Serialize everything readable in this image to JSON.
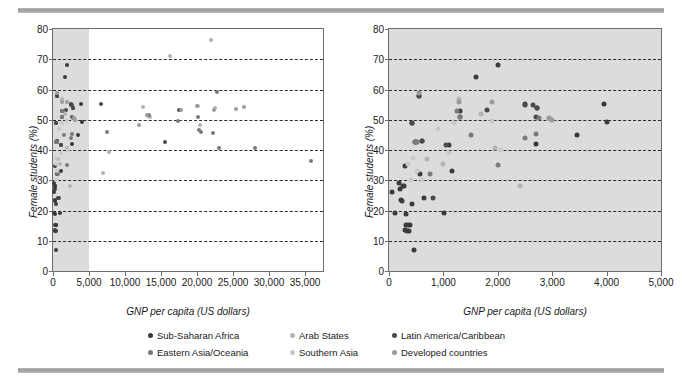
{
  "figure": {
    "background": "#ffffff",
    "rule_color": "#a8a8a8",
    "shade_color": "#dcdcdc",
    "frame_color": "#6e6e6e"
  },
  "series_colors": {
    "sub_saharan_africa": "#3a3a3a",
    "arab_states": "#b4b4b4",
    "latin_america_caribbean": "#4a4a4a",
    "eastern_asia_oceania": "#7a7a7a",
    "southern_asia": "#c9c9c9",
    "developed_countries": "#9b9b9b"
  },
  "legend": {
    "position": "bottom-center",
    "entries": [
      {
        "label": "Sub-Saharan Africa",
        "key": "sub_saharan_africa",
        "color": "#3a3a3a"
      },
      {
        "label": "Arab States",
        "key": "arab_states",
        "color": "#b4b4b4"
      },
      {
        "label": "Latin America/Caribbean",
        "key": "latin_america_caribbean",
        "color": "#4a4a4a"
      },
      {
        "label": "Eastern Asia/Oceania",
        "key": "eastern_asia_oceania",
        "color": "#7a7a7a"
      },
      {
        "label": "Southern Asia",
        "key": "southern_asia",
        "color": "#c9c9c9"
      },
      {
        "label": "Developed countries",
        "key": "developed_countries",
        "color": "#9b9b9b"
      }
    ]
  },
  "chart_data": [
    {
      "id": "left",
      "type": "scatter",
      "title": "",
      "xlabel": "GNP per capita (US dollars)",
      "ylabel": "Female students (%)",
      "xlim": [
        0,
        37500
      ],
      "ylim": [
        0,
        80
      ],
      "xticks": [
        0,
        5000,
        10000,
        15000,
        20000,
        25000,
        30000,
        35000
      ],
      "xtick_labels": [
        "0",
        "5,000",
        "10,000",
        "15,000",
        "20,000",
        "25,000",
        "30,000",
        "35,000"
      ],
      "yticks": [
        0,
        10,
        20,
        30,
        40,
        50,
        60,
        70,
        80
      ],
      "ytick_labels": [
        "0",
        "10",
        "20",
        "30",
        "40",
        "50",
        "60",
        "70",
        "80"
      ],
      "grid": "horizontal-dashed",
      "shaded_x_range": [
        0,
        5000
      ],
      "shade_note": "grey band marks the 0-5,000 region enlarged in the right panel",
      "series": [
        {
          "name": "Sub-Saharan Africa",
          "key": "sub_saharan_africa",
          "points": [
            [
              120,
              26.2
            ],
            [
              150,
              19.3
            ],
            [
              200,
              29.0
            ],
            [
              210,
              27.0
            ],
            [
              230,
              23.5
            ],
            [
              250,
              23.3
            ],
            [
              260,
              28.0
            ],
            [
              280,
              28.0
            ],
            [
              290,
              13.5
            ],
            [
              300,
              34.8
            ],
            [
              310,
              19.0
            ],
            [
              330,
              15.2
            ],
            [
              340,
              13.2
            ],
            [
              350,
              15.2
            ],
            [
              360,
              13.2
            ],
            [
              380,
              15.2
            ],
            [
              400,
              22.0
            ],
            [
              430,
              49.0
            ],
            [
              450,
              7.0
            ],
            [
              470,
              42.8
            ],
            [
              500,
              42.8
            ],
            [
              520,
              58.0
            ],
            [
              560,
              32.0
            ],
            [
              600,
              43.0
            ],
            [
              640,
              24.2
            ],
            [
              1020,
              19.2
            ],
            [
              1100,
              41.8
            ],
            [
              1150,
              33.0
            ],
            [
              1300,
              53.0
            ],
            [
              1600,
              64.2
            ],
            [
              2000,
              68.2
            ],
            [
              2500,
              55.2
            ],
            [
              2700,
              42.0
            ],
            [
              2720,
              54.0
            ],
            [
              3450,
              45.0
            ],
            [
              3950,
              55.2
            ],
            [
              4000,
              49.2
            ]
          ]
        },
        {
          "name": "Arab States",
          "key": "arab_states",
          "points": [
            [
              700,
              37.0
            ],
            [
              1000,
              35.5
            ],
            [
              1280,
              57.0
            ],
            [
              1700,
              52.0
            ],
            [
              1950,
              40.5
            ],
            [
              2400,
              28.0
            ],
            [
              2950,
              50.5
            ],
            [
              3000,
              50.0
            ],
            [
              7000,
              32.3
            ],
            [
              7800,
              39.5
            ],
            [
              12500,
              54.2
            ],
            [
              13200,
              51.2
            ],
            [
              13500,
              51.0
            ],
            [
              16300,
              71.2
            ],
            [
              20200,
              54.5
            ],
            [
              20400,
              48.2
            ],
            [
              22000,
              76.2
            ],
            [
              22500,
              54.0
            ]
          ]
        },
        {
          "name": "Latin America/Caribbean",
          "key": "latin_america_caribbean",
          "points": [
            [
              420,
              49.0
            ],
            [
              560,
              58.0
            ],
            [
              600,
              43.0
            ],
            [
              800,
              24.2
            ],
            [
              1050,
              41.8
            ],
            [
              1300,
              51.0
            ],
            [
              1800,
              53.2
            ],
            [
              2500,
              55.0
            ],
            [
              2650,
              55.0
            ],
            [
              2700,
              51.0
            ],
            [
              2720,
              54.0
            ],
            [
              6700,
              55.2
            ],
            [
              15500,
              42.5
            ],
            [
              17500,
              53.2
            ]
          ]
        },
        {
          "name": "Eastern Asia/Oceania",
          "key": "eastern_asia_oceania",
          "points": [
            [
              480,
              42.8
            ],
            [
              520,
              42.8
            ],
            [
              760,
              32.0
            ],
            [
              1250,
              53.0
            ],
            [
              1300,
              51.0
            ],
            [
              1500,
              45.0
            ],
            [
              2000,
              35.2
            ],
            [
              2500,
              44.0
            ],
            [
              2700,
              45.2
            ],
            [
              2750,
              50.5
            ],
            [
              7500,
              46.0
            ],
            [
              13300,
              51.5
            ],
            [
              17300,
              49.5
            ],
            [
              20100,
              51.0
            ],
            [
              20300,
              46.5
            ],
            [
              20500,
              46.0
            ],
            [
              22200,
              45.5
            ],
            [
              22800,
              59.3
            ],
            [
              23000,
              40.5
            ],
            [
              28000,
              40.5
            ],
            [
              35900,
              36.5
            ]
          ]
        },
        {
          "name": "Southern Asia",
          "key": "southern_asia",
          "points": [
            [
              350,
              35.5
            ],
            [
              400,
              30.0
            ],
            [
              450,
              37.5
            ],
            [
              520,
              33.0
            ],
            [
              600,
              30.0
            ],
            [
              900,
              46.8
            ],
            [
              1100,
              39.0
            ],
            [
              1200,
              49.0
            ],
            [
              1900,
              49.5
            ],
            [
              2050,
              40.0
            ]
          ]
        },
        {
          "name": "Developed countries",
          "key": "developed_countries",
          "points": [
            [
              560,
              59.0
            ],
            [
              1280,
              55.8
            ],
            [
              1900,
              56.0
            ],
            [
              2950,
              50.5
            ],
            [
              3000,
              50.0
            ],
            [
              11900,
              48.2
            ],
            [
              13100,
              51.5
            ],
            [
              17800,
              53.3
            ],
            [
              20000,
              54.5
            ],
            [
              22400,
              53.3
            ],
            [
              25400,
              53.5
            ],
            [
              26500,
              54.3
            ]
          ]
        }
      ]
    },
    {
      "id": "right",
      "type": "scatter",
      "title": "",
      "xlabel": "GNP per capita (US dollars)",
      "ylabel": "Female students (%)",
      "xlim": [
        0,
        5000
      ],
      "ylim": [
        0,
        80
      ],
      "xticks": [
        0,
        1000,
        2000,
        3000,
        4000,
        5000
      ],
      "xtick_labels": [
        "0",
        "1,000",
        "2,000",
        "3,000",
        "4,000",
        "5,000"
      ],
      "yticks": [
        0,
        10,
        20,
        30,
        40,
        50,
        60,
        70,
        80
      ],
      "ytick_labels": [
        "0",
        "10",
        "20",
        "30",
        "40",
        "50",
        "60",
        "70",
        "80"
      ],
      "grid": "horizontal-dashed",
      "plot_background": "#dcdcdc",
      "note": "enlargement of the shaded 0-5,000 band of the left panel",
      "series": [
        {
          "name": "Sub-Saharan Africa",
          "key": "sub_saharan_africa",
          "points": [
            [
              60,
              26.2
            ],
            [
              110,
              19.3
            ],
            [
              180,
              29.0
            ],
            [
              200,
              27.0
            ],
            [
              215,
              23.5
            ],
            [
              240,
              23.3
            ],
            [
              255,
              28.0
            ],
            [
              275,
              28.0
            ],
            [
              285,
              13.5
            ],
            [
              300,
              34.8
            ],
            [
              305,
              19.0
            ],
            [
              320,
              15.2
            ],
            [
              330,
              13.2
            ],
            [
              345,
              15.2
            ],
            [
              360,
              13.2
            ],
            [
              380,
              15.2
            ],
            [
              420,
              22.0
            ],
            [
              430,
              49.0
            ],
            [
              455,
              7.0
            ],
            [
              470,
              42.8
            ],
            [
              505,
              42.8
            ],
            [
              555,
              58.0
            ],
            [
              565,
              32.0
            ],
            [
              600,
              43.0
            ],
            [
              640,
              24.2
            ],
            [
              1020,
              19.2
            ],
            [
              1100,
              41.8
            ],
            [
              1150,
              33.0
            ],
            [
              1300,
              53.0
            ],
            [
              1600,
              64.2
            ],
            [
              2000,
              68.2
            ],
            [
              2500,
              55.2
            ],
            [
              2700,
              42.0
            ],
            [
              2720,
              54.0
            ],
            [
              3450,
              45.0
            ],
            [
              3950,
              55.2
            ],
            [
              4000,
              49.2
            ]
          ]
        },
        {
          "name": "Arab States",
          "key": "arab_states",
          "points": [
            [
              700,
              37.0
            ],
            [
              1000,
              35.5
            ],
            [
              1280,
              57.0
            ],
            [
              1700,
              52.0
            ],
            [
              1950,
              40.5
            ],
            [
              2400,
              28.0
            ],
            [
              2950,
              50.5
            ],
            [
              3000,
              50.0
            ]
          ]
        },
        {
          "name": "Latin America/Caribbean",
          "key": "latin_america_caribbean",
          "points": [
            [
              420,
              49.0
            ],
            [
              555,
              58.0
            ],
            [
              600,
              43.0
            ],
            [
              800,
              24.2
            ],
            [
              1050,
              41.8
            ],
            [
              1300,
              51.0
            ],
            [
              1800,
              53.2
            ],
            [
              2500,
              55.0
            ],
            [
              2650,
              55.0
            ],
            [
              2700,
              51.0
            ],
            [
              2720,
              54.0
            ]
          ]
        },
        {
          "name": "Eastern Asia/Oceania",
          "key": "eastern_asia_oceania",
          "points": [
            [
              480,
              42.8
            ],
            [
              520,
              42.8
            ],
            [
              760,
              32.0
            ],
            [
              1250,
              53.0
            ],
            [
              1300,
              51.0
            ],
            [
              1500,
              45.0
            ],
            [
              2000,
              35.2
            ],
            [
              2500,
              44.0
            ],
            [
              2700,
              45.2
            ],
            [
              2750,
              50.5
            ]
          ]
        },
        {
          "name": "Southern Asia",
          "key": "southern_asia",
          "points": [
            [
              350,
              35.5
            ],
            [
              400,
              30.0
            ],
            [
              450,
              37.5
            ],
            [
              520,
              33.0
            ],
            [
              600,
              30.0
            ],
            [
              900,
              46.8
            ],
            [
              1100,
              39.0
            ],
            [
              1200,
              49.0
            ],
            [
              1900,
              49.5
            ],
            [
              2050,
              40.0
            ]
          ]
        },
        {
          "name": "Developed countries",
          "key": "developed_countries",
          "points": [
            [
              555,
              59.0
            ],
            [
              1280,
              55.8
            ],
            [
              1900,
              56.0
            ],
            [
              2950,
              50.5
            ],
            [
              3000,
              50.0
            ]
          ]
        }
      ]
    }
  ]
}
